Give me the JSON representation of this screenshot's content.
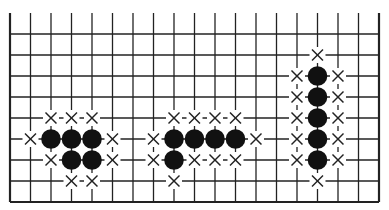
{
  "board": {
    "origin_x": 10,
    "origin_y": 34,
    "dx": 20.5,
    "dy": 21,
    "cols": 18,
    "rows": 8,
    "top_y": 13,
    "line_color": "#222222",
    "stone_color": "#111111",
    "mark_color": "#222222"
  },
  "groups": [
    {
      "name": "group-left",
      "stones": [
        [
          2,
          5
        ],
        [
          3,
          5
        ],
        [
          4,
          5
        ],
        [
          3,
          6
        ],
        [
          4,
          6
        ]
      ],
      "marks": [
        [
          2,
          4
        ],
        [
          3,
          4
        ],
        [
          4,
          4
        ],
        [
          1,
          5
        ],
        [
          5,
          5
        ],
        [
          2,
          6
        ],
        [
          5,
          6
        ],
        [
          3,
          7
        ],
        [
          4,
          7
        ]
      ]
    },
    {
      "name": "group-middle",
      "stones": [
        [
          8,
          5
        ],
        [
          9,
          5
        ],
        [
          10,
          5
        ],
        [
          11,
          5
        ],
        [
          8,
          6
        ]
      ],
      "marks": [
        [
          8,
          4
        ],
        [
          9,
          4
        ],
        [
          10,
          4
        ],
        [
          11,
          4
        ],
        [
          7,
          5
        ],
        [
          12,
          5
        ],
        [
          7,
          6
        ],
        [
          9,
          6
        ],
        [
          10,
          6
        ],
        [
          11,
          6
        ],
        [
          8,
          7
        ]
      ]
    },
    {
      "name": "group-right",
      "stones": [
        [
          15,
          2
        ],
        [
          15,
          3
        ],
        [
          15,
          4
        ],
        [
          15,
          5
        ],
        [
          15,
          6
        ]
      ],
      "marks": [
        [
          15,
          1
        ],
        [
          14,
          2
        ],
        [
          16,
          2
        ],
        [
          14,
          3
        ],
        [
          16,
          3
        ],
        [
          14,
          4
        ],
        [
          16,
          4
        ],
        [
          14,
          5
        ],
        [
          16,
          5
        ],
        [
          14,
          6
        ],
        [
          16,
          6
        ],
        [
          15,
          7
        ]
      ]
    }
  ]
}
